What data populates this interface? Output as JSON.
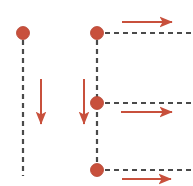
{
  "figure": {
    "title": "",
    "width": 193,
    "height": 186,
    "background": "#ffffff"
  },
  "style": {
    "dot_color": "#c8503c",
    "dot_stroke": "#b4412e",
    "arrow_color": "#c8503c",
    "dashed_color": "#4a4a4a",
    "dot_radius": 6.5,
    "dash_pattern": "5,4",
    "dash_width": 2.2,
    "arrow_width": 2.0
  },
  "nodes": [
    {
      "id": "node-left-top",
      "label": "",
      "cx": 23,
      "cy": 33,
      "color": "#c8503c"
    },
    {
      "id": "node-right-top",
      "label": "",
      "cx": 97,
      "cy": 33,
      "color": "#c8503c"
    },
    {
      "id": "node-right-middle",
      "label": "",
      "cx": 97,
      "cy": 103,
      "color": "#c8503c"
    },
    {
      "id": "node-right-bottom",
      "label": "",
      "cx": 97,
      "cy": 170,
      "color": "#c8503c"
    }
  ],
  "dashed_lines": [
    {
      "id": "dashed-vertical-left",
      "orientation": "vertical",
      "x1": 23,
      "y1": 40,
      "x2": 23,
      "y2": 176
    },
    {
      "id": "dashed-vertical-right",
      "orientation": "vertical",
      "x1": 97,
      "y1": 40,
      "x2": 97,
      "y2": 164
    },
    {
      "id": "dashed-horizontal-top",
      "orientation": "horizontal",
      "x1": 105,
      "y1": 33,
      "x2": 192,
      "y2": 33
    },
    {
      "id": "dashed-horizontal-middle",
      "orientation": "horizontal",
      "x1": 105,
      "y1": 103,
      "x2": 192,
      "y2": 103
    },
    {
      "id": "dashed-horizontal-bottom",
      "orientation": "horizontal",
      "x1": 105,
      "y1": 170,
      "x2": 192,
      "y2": 170
    }
  ],
  "arrows": [
    {
      "id": "arrow-down-left",
      "direction": "down",
      "x1": 41,
      "y1": 79,
      "x2": 41,
      "y2": 124
    },
    {
      "id": "arrow-down-right",
      "direction": "down",
      "x1": 84,
      "y1": 79,
      "x2": 84,
      "y2": 124
    },
    {
      "id": "arrow-right-top",
      "direction": "right",
      "x1": 122,
      "y1": 22,
      "x2": 172,
      "y2": 22
    },
    {
      "id": "arrow-right-middle",
      "direction": "right",
      "x1": 121,
      "y1": 112,
      "x2": 172,
      "y2": 112
    },
    {
      "id": "arrow-right-bottom",
      "direction": "right",
      "x1": 122,
      "y1": 179,
      "x2": 171,
      "y2": 179
    }
  ]
}
